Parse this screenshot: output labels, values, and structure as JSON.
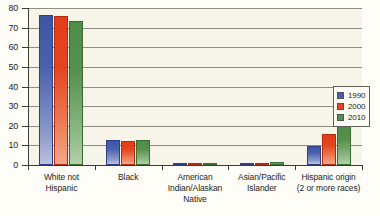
{
  "chart_data": {
    "type": "bar",
    "title": "",
    "xlabel": "",
    "ylabel": "",
    "ylim": [
      0,
      80
    ],
    "yticks": [
      0,
      10,
      20,
      30,
      40,
      50,
      60,
      70,
      80
    ],
    "ytick_labels": [
      "0",
      "10",
      "20",
      "30",
      "40",
      "50",
      "60",
      "70",
      "80"
    ],
    "grid": true,
    "legend_position": "right",
    "categories": [
      "White not Hispanic",
      "Black",
      "American Indian/Alaskan Native",
      "Asian/Pacific Islander",
      "Hispanic origin (2 or more races)"
    ],
    "category_lines": [
      [
        "White not",
        "Hispanic"
      ],
      [
        "Black"
      ],
      [
        "American",
        "Indian/Alaskan",
        "Native"
      ],
      [
        "Asian/Pacific",
        "Islander"
      ],
      [
        "Hispanic origin",
        "(2 or more races)"
      ]
    ],
    "series": [
      {
        "name": "1990",
        "color": "#4a62ad",
        "values": [
          76.5,
          12.5,
          0.8,
          0.7,
          9.5
        ]
      },
      {
        "name": "2000",
        "color": "#e4461f",
        "values": [
          75.8,
          12.4,
          0.9,
          1.2,
          16.0
        ]
      },
      {
        "name": "2010",
        "color": "#55914d",
        "values": [
          73.2,
          12.9,
          0.9,
          1.5,
          20.0
        ]
      }
    ]
  },
  "legend": {
    "items": [
      {
        "label": "1990",
        "color": "#4a62ad"
      },
      {
        "label": "2000",
        "color": "#e4461f"
      },
      {
        "label": "2010",
        "color": "#55914d"
      }
    ]
  },
  "colors": {
    "background": "#fefdf7",
    "plot_background": "#f7f5ea",
    "gridline": "#8d8d85",
    "axis": "#3a3a36",
    "text": "#1d1d1b"
  }
}
